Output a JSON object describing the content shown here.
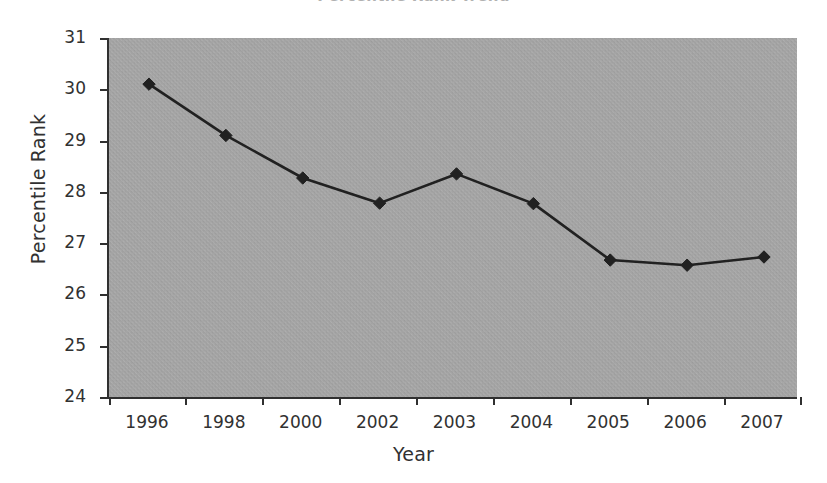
{
  "figure": {
    "title_sliver": "Percentile Rank Trend",
    "background_color": "#ffffff",
    "plot_background_color": "#a9a9a9",
    "axis_color": "#2a2a2a",
    "series_color": "#1a1a1a"
  },
  "chart_data": {
    "type": "line",
    "title": "",
    "xlabel": "Year",
    "ylabel": "Percentile Rank",
    "categories": [
      "1996",
      "1998",
      "2000",
      "2002",
      "2003",
      "2004",
      "2005",
      "2006",
      "2007"
    ],
    "values": [
      30.1,
      29.1,
      28.27,
      27.78,
      28.35,
      27.77,
      26.67,
      26.57,
      26.73
    ],
    "series": [
      {
        "name": "Percentile Rank",
        "values": [
          30.1,
          29.1,
          28.27,
          27.78,
          28.35,
          27.77,
          26.67,
          26.57,
          26.73
        ],
        "marker": "diamond",
        "color": "#1a1a1a"
      }
    ],
    "ylim": [
      24,
      31
    ],
    "ytick_labels": [
      "31",
      "30",
      "29",
      "28",
      "27",
      "26",
      "25",
      "24"
    ],
    "ytick_values": [
      31,
      30,
      29,
      28,
      27,
      26,
      25,
      24
    ],
    "grid": false,
    "legend": false,
    "legend_position": "none"
  }
}
